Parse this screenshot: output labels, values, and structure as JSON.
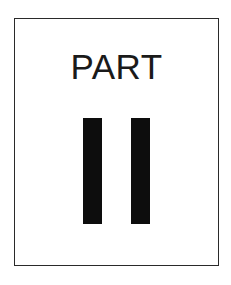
{
  "page": {
    "kind": "book-part-divider-page",
    "background_color": "#ffffff",
    "frame": {
      "border_color": "#2a2a2a",
      "fill_color": "#ffffff"
    }
  },
  "divider": {
    "title": "PART",
    "title_color": "#1a1a1a",
    "numeral": {
      "text": "II",
      "value": 2,
      "style": "roman",
      "color": "#0d0d0d",
      "bars": [
        {
          "name": "numeral-stroke-1"
        },
        {
          "name": "numeral-stroke-2"
        }
      ]
    }
  }
}
